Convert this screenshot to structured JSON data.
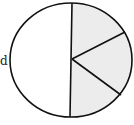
{
  "diagram": {
    "type": "circle-partition",
    "left_label_fragment": "d",
    "left_half": {
      "fill": "#ffffff"
    },
    "right_half": {
      "fill": "#ececec",
      "sectors": 3
    },
    "stroke": "#111111"
  }
}
